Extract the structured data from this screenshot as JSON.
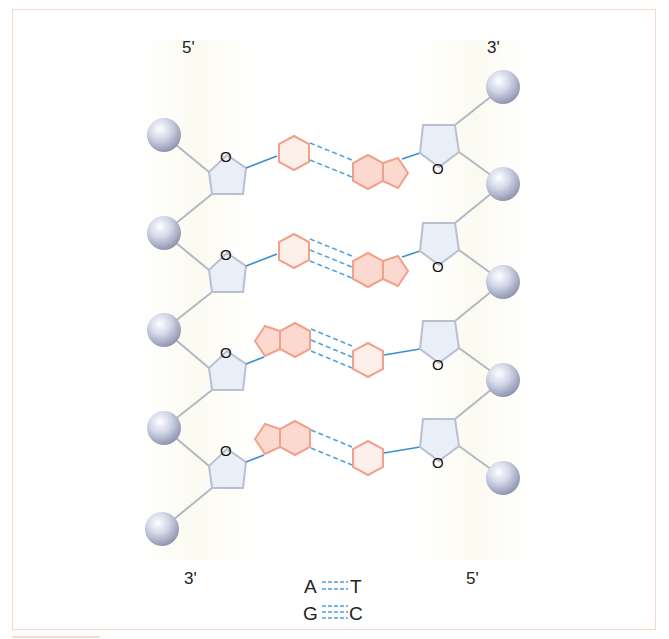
{
  "diagram": {
    "type": "DNA double strand base pairing",
    "strand_labels": {
      "left_top": "5'",
      "right_top": "3'",
      "left_bottom": "3'",
      "right_bottom": "5'"
    },
    "sugar_label": "O",
    "base_pairs": [
      {
        "left": "pyrimidine",
        "right": "purine",
        "hbonds": 2
      },
      {
        "left": "pyrimidine",
        "right": "purine",
        "hbonds": 3
      },
      {
        "left": "purine",
        "right": "pyrimidine",
        "hbonds": 3
      },
      {
        "left": "purine",
        "right": "pyrimidine",
        "hbonds": 2
      }
    ],
    "legend": [
      {
        "left": "A",
        "right": "T",
        "hbonds": 2
      },
      {
        "left": "G",
        "right": "C",
        "hbonds": 3
      }
    ],
    "colors": {
      "frame": "#f3d9c8",
      "phosphate": "#b9bfd6",
      "sugar_fill": "#e9eef7",
      "sugar_stroke": "#b8bfd0",
      "backbone": "#b5b8c0",
      "base_fill": "#fbe0d8",
      "base_stroke": "#f2a08c",
      "glycosidic_bond": "#3b8fd0",
      "hydrogen_bond": "#4aa3e0"
    }
  }
}
